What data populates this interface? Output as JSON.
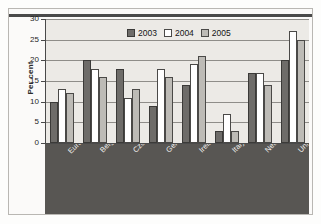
{
  "chart_data": {
    "type": "bar",
    "title": "",
    "subtitle": "",
    "xlabel": "",
    "ylabel": "Per cent",
    "ylim": [
      0,
      30
    ],
    "yticks": [
      0,
      5,
      10,
      15,
      20,
      25,
      30
    ],
    "grid": true,
    "legend_position": "top-center",
    "categories": [
      "European Union(1)",
      "Belgium",
      "Czech Republic",
      "Germany",
      "Ireland",
      "Italy",
      "Netherlands",
      "United Kingdom"
    ],
    "series": [
      {
        "name": "2003",
        "color": "#6e6c69",
        "values": [
          10,
          20,
          18,
          9,
          14,
          3,
          17,
          20
        ]
      },
      {
        "name": "2004",
        "color": "#ffffff",
        "values": [
          13,
          18,
          11,
          18,
          19,
          7,
          17,
          27
        ]
      },
      {
        "name": "2005",
        "color": "#bdbbb6",
        "values": [
          12,
          16,
          13,
          16,
          21,
          3,
          14,
          25
        ]
      }
    ]
  },
  "legend": {
    "items": [
      {
        "label": "2003"
      },
      {
        "label": "2004"
      },
      {
        "label": "2005"
      }
    ]
  },
  "axis": {
    "y_title": "Per cent",
    "y_tick_labels": [
      "30",
      "25",
      "20",
      "15",
      "10",
      "5",
      "0"
    ]
  },
  "colors": {
    "series_2003": "#6e6c69",
    "series_2004": "#ffffff",
    "series_2005": "#bdbbb6",
    "plot_background": "#eceae6",
    "category_band": "#585653",
    "axis_line": "#4a4a4a",
    "gridline": "#8f8d89"
  }
}
